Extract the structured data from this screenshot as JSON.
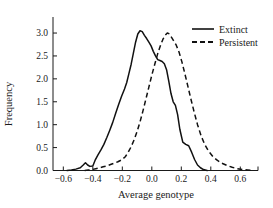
{
  "chart_data": {
    "type": "line",
    "title": "",
    "xlabel": "Average genotype",
    "ylabel": "Frequency",
    "xlim": [
      -0.67,
      0.72
    ],
    "ylim": [
      0.0,
      3.35
    ],
    "grid": false,
    "legend_position": "top-right",
    "xticks": [
      -0.6,
      -0.4,
      -0.2,
      0.0,
      0.2,
      0.4,
      0.6
    ],
    "xtick_labels": [
      "−0.6",
      "−0.4",
      "−0.2",
      "0.0",
      "0.2",
      "0.4",
      "0.6"
    ],
    "yticks": [
      0.0,
      0.5,
      1.0,
      1.5,
      2.0,
      2.5,
      3.0
    ],
    "ytick_labels": [
      "0.0",
      "0.5",
      "1.0",
      "1.5",
      "2.0",
      "2.5",
      "3.0"
    ],
    "series": [
      {
        "name": "Extinct",
        "style": "solid",
        "color": "#111111",
        "x": [
          -0.575,
          -0.545,
          -0.515,
          -0.485,
          -0.465,
          -0.45,
          -0.435,
          -0.42,
          -0.4,
          -0.385,
          -0.365,
          -0.345,
          -0.325,
          -0.305,
          -0.285,
          -0.265,
          -0.245,
          -0.225,
          -0.205,
          -0.185,
          -0.17,
          -0.155,
          -0.14,
          -0.125,
          -0.11,
          -0.095,
          -0.08,
          -0.065,
          -0.05,
          -0.035,
          -0.02,
          -0.005,
          0.01,
          0.025,
          0.04,
          0.055,
          0.07,
          0.085,
          0.1,
          0.115,
          0.13,
          0.145,
          0.16,
          0.175,
          0.19,
          0.21,
          0.23,
          0.25,
          0.27,
          0.29,
          0.31,
          0.33,
          0.35,
          0.375
        ],
        "y": [
          0.0,
          0.01,
          0.03,
          0.06,
          0.12,
          0.17,
          0.12,
          0.09,
          0.1,
          0.22,
          0.34,
          0.45,
          0.57,
          0.72,
          0.88,
          1.05,
          1.25,
          1.44,
          1.62,
          1.78,
          1.92,
          2.12,
          2.32,
          2.56,
          2.8,
          2.98,
          3.05,
          3.03,
          2.95,
          2.88,
          2.8,
          2.72,
          2.6,
          2.5,
          2.42,
          2.4,
          2.38,
          2.33,
          2.2,
          1.95,
          1.68,
          1.5,
          1.42,
          1.22,
          0.9,
          0.62,
          0.57,
          0.54,
          0.4,
          0.24,
          0.12,
          0.06,
          0.02,
          0.0
        ]
      },
      {
        "name": "Persistent",
        "style": "dashed",
        "color": "#111111",
        "x": [
          -0.455,
          -0.43,
          -0.405,
          -0.38,
          -0.355,
          -0.33,
          -0.305,
          -0.28,
          -0.255,
          -0.23,
          -0.205,
          -0.18,
          -0.16,
          -0.14,
          -0.12,
          -0.1,
          -0.08,
          -0.06,
          -0.04,
          -0.02,
          0.0,
          0.02,
          0.04,
          0.06,
          0.075,
          0.09,
          0.105,
          0.12,
          0.135,
          0.15,
          0.165,
          0.185,
          0.205,
          0.225,
          0.245,
          0.265,
          0.285,
          0.31,
          0.335,
          0.36,
          0.385,
          0.415,
          0.445,
          0.475,
          0.51,
          0.545,
          0.58,
          0.615,
          0.65,
          0.68
        ],
        "y": [
          0.0,
          0.01,
          0.02,
          0.04,
          0.06,
          0.08,
          0.1,
          0.13,
          0.16,
          0.19,
          0.23,
          0.3,
          0.4,
          0.52,
          0.67,
          0.85,
          1.06,
          1.3,
          1.56,
          1.82,
          2.08,
          2.32,
          2.55,
          2.74,
          2.86,
          2.95,
          3.0,
          2.98,
          2.9,
          2.82,
          2.74,
          2.58,
          2.36,
          2.1,
          1.83,
          1.56,
          1.3,
          1.0,
          0.75,
          0.56,
          0.42,
          0.3,
          0.22,
          0.16,
          0.11,
          0.07,
          0.04,
          0.02,
          0.01,
          0.0
        ]
      }
    ]
  },
  "legend": {
    "items": [
      {
        "label": "Extinct",
        "style": "solid"
      },
      {
        "label": "Persistent",
        "style": "dashed"
      }
    ]
  }
}
